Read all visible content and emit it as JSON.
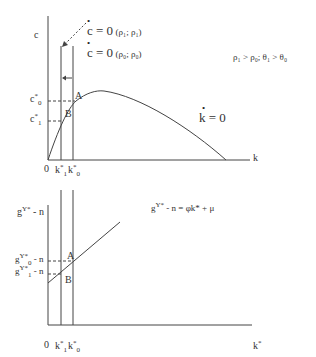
{
  "top_panel": {
    "y_axis_label": "c",
    "x_axis_label": "k",
    "origin_label": "0",
    "x_ticks": [
      {
        "base": "k",
        "sup": "*",
        "sub": "1"
      },
      {
        "base": "k",
        "sup": "*",
        "sub": "0"
      }
    ],
    "y_ticks": [
      {
        "base": "c",
        "sup": "*",
        "sub": "0"
      },
      {
        "base": "c",
        "sup": "*",
        "sub": "1"
      }
    ],
    "curve_label": "k = 0",
    "c_dot_new": {
      "lhs": "c = 0",
      "args": "(ρ₁; ρ₁)"
    },
    "c_dot_old": {
      "lhs": "c = 0",
      "args": "(ρ₀; ρ₀)"
    },
    "condition": "ρ₁ > ρ₀; θ₁ > θ₀",
    "point_A": "A",
    "point_B": "B"
  },
  "bottom_panel": {
    "y_axis_label": {
      "base": "g",
      "sup": "Y*",
      "tail": " - n"
    },
    "x_axis_label": {
      "base": "k",
      "sup": "*"
    },
    "origin_label": "0",
    "x_ticks": [
      {
        "base": "k",
        "sup": "*",
        "sub": "1"
      },
      {
        "base": "k",
        "sup": "*",
        "sub": "0"
      }
    ],
    "y_ticks": [
      {
        "base": "g",
        "sup": "Y*",
        "sub": "0",
        "tail": " - n"
      },
      {
        "base": "g",
        "sup": "Y*",
        "sub": "1",
        "tail": " - n"
      }
    ],
    "line_label": {
      "base": "g",
      "sup": "Y*",
      "tail": " - n = φk* + μ"
    },
    "point_A": "A",
    "point_B": "B"
  }
}
